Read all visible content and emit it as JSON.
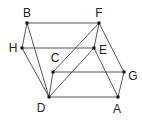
{
  "diagram": {
    "type": "geometry-figure",
    "points": [
      {
        "id": "B",
        "x": 27,
        "y": 23,
        "lx": 27,
        "ly": 17,
        "anchor": "middle"
      },
      {
        "id": "F",
        "x": 99,
        "y": 23,
        "lx": 99,
        "ly": 17,
        "anchor": "middle"
      },
      {
        "id": "H",
        "x": 22,
        "y": 48,
        "lx": 13,
        "ly": 52,
        "anchor": "middle"
      },
      {
        "id": "E",
        "x": 94,
        "y": 48,
        "lx": 103,
        "ly": 54,
        "anchor": "middle"
      },
      {
        "id": "C",
        "x": 53,
        "y": 72,
        "lx": 55,
        "ly": 62,
        "anchor": "middle"
      },
      {
        "id": "G",
        "x": 124,
        "y": 72,
        "lx": 133,
        "ly": 80,
        "anchor": "middle"
      },
      {
        "id": "D",
        "x": 49,
        "y": 97,
        "lx": 41,
        "ly": 112,
        "anchor": "middle"
      },
      {
        "id": "A",
        "x": 118,
        "y": 97,
        "lx": 117,
        "ly": 113,
        "anchor": "middle"
      }
    ],
    "edges": [
      [
        "B",
        "F"
      ],
      [
        "B",
        "H"
      ],
      [
        "B",
        "D"
      ],
      [
        "H",
        "E"
      ],
      [
        "H",
        "D"
      ],
      [
        "F",
        "E"
      ],
      [
        "F",
        "C"
      ],
      [
        "F",
        "G"
      ],
      [
        "E",
        "D"
      ],
      [
        "E",
        "A"
      ],
      [
        "C",
        "G"
      ],
      [
        "C",
        "D"
      ],
      [
        "D",
        "A"
      ],
      [
        "A",
        "G"
      ]
    ],
    "colors": {
      "line": "#444444",
      "point": "#111111"
    }
  }
}
